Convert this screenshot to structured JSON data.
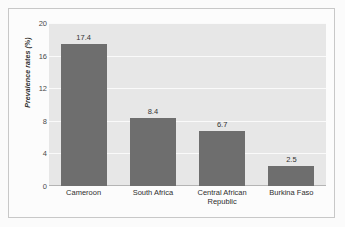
{
  "chart_data": {
    "type": "bar",
    "title": "",
    "xlabel": "",
    "ylabel": "Prevalence rates (%)",
    "categories": [
      "Cameroon",
      "South Africa",
      "Central African Republic",
      "Burkina Faso"
    ],
    "category_lines": [
      [
        "Cameroon"
      ],
      [
        "South Africa"
      ],
      [
        "Central African",
        "Republic"
      ],
      [
        "Burkina Faso"
      ]
    ],
    "values": [
      17.4,
      8.4,
      6.7,
      2.5
    ],
    "value_labels": [
      "17.4",
      "8.4",
      "6.7",
      "2.5"
    ],
    "ylim": [
      0,
      20
    ],
    "ytick_values": [
      0,
      4,
      8,
      12,
      16,
      20
    ],
    "ytick_labels": [
      "0",
      "4",
      "8",
      "12",
      "16",
      "20"
    ],
    "grid": true,
    "legend": "none",
    "colors": {
      "bar_fill": "#6e6e6e",
      "plot_background": "#e7e7e7",
      "gridline": "#fafafa",
      "axis_line": "#b4b4b4",
      "frame_border": "#c8c8c8",
      "page_background": "#fbfbfb",
      "text": "#333333"
    }
  }
}
